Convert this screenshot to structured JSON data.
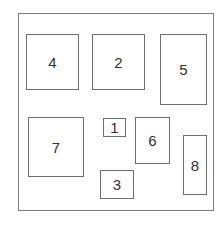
{
  "diagram": {
    "boxes": [
      {
        "label": "4",
        "x": 26,
        "y": 34,
        "w": 53,
        "h": 56
      },
      {
        "label": "2",
        "x": 92,
        "y": 34,
        "w": 53,
        "h": 56
      },
      {
        "label": "5",
        "x": 160,
        "y": 34,
        "w": 47,
        "h": 71
      },
      {
        "label": "7",
        "x": 28,
        "y": 117,
        "w": 56,
        "h": 60
      },
      {
        "label": "1",
        "x": 103,
        "y": 118,
        "w": 23,
        "h": 19
      },
      {
        "label": "6",
        "x": 135,
        "y": 117,
        "w": 35,
        "h": 47
      },
      {
        "label": "8",
        "x": 183,
        "y": 135,
        "w": 24,
        "h": 60
      },
      {
        "label": "3",
        "x": 100,
        "y": 170,
        "w": 34,
        "h": 29
      }
    ]
  }
}
